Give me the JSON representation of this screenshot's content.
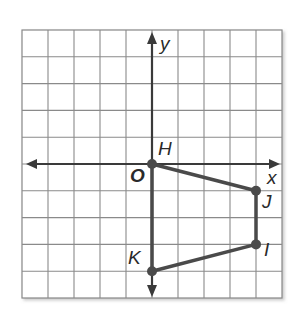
{
  "figure": {
    "type": "coordinate-grid-polygon",
    "axes": {
      "x_label": "x",
      "y_label": "y",
      "origin_label": "O"
    },
    "grid": {
      "columns": 10,
      "rows": 10,
      "x_range": [
        -5,
        5
      ],
      "y_range": [
        -5,
        5
      ]
    },
    "polygon": {
      "vertices": [
        {
          "label": "H",
          "x": 0,
          "y": 0
        },
        {
          "label": "J",
          "x": 4,
          "y": -1
        },
        {
          "label": "I",
          "x": 4,
          "y": -3
        },
        {
          "label": "K",
          "x": 0,
          "y": -4
        }
      ],
      "color": "#4a4a4a"
    }
  }
}
